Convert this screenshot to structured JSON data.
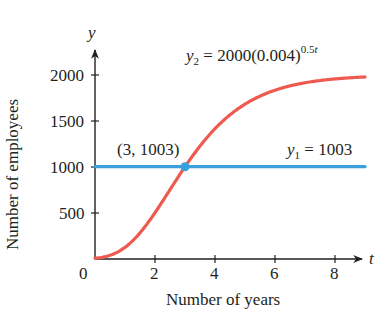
{
  "chart_data": {
    "type": "line",
    "title": "",
    "xlabel": "Number of years",
    "ylabel": "Number of employees",
    "x_axis_symbol": "t",
    "y_axis_symbol": "y",
    "xlim": [
      0,
      9
    ],
    "ylim": [
      0,
      2200
    ],
    "x_ticks": [
      2,
      4,
      6,
      8
    ],
    "x_tick_labels": [
      "2",
      "4",
      "6",
      "8"
    ],
    "origin_label": "0",
    "y_ticks": [
      500,
      1000,
      1500,
      2000
    ],
    "y_tick_labels": [
      "500",
      "1000",
      "1500",
      "2000"
    ],
    "grid": false,
    "series": [
      {
        "name": "y2",
        "label_var": "y",
        "label_sub": "2",
        "label_eq": "= 2000(0.004)",
        "label_exp": "0.5",
        "label_exp_var": "t",
        "formula": "y2 = 2000(0.004)^(0.5^t)",
        "color": "#ee5a50",
        "x": [
          0,
          0.5,
          1,
          1.5,
          2,
          2.5,
          3,
          3.5,
          4,
          4.5,
          5,
          5.5,
          6,
          6.5,
          7,
          7.5,
          8,
          8.5,
          9
        ],
        "values": [
          8,
          40,
          126,
          281,
          503,
          760,
          1003,
          1207,
          1410,
          1567,
          1689,
          1780,
          1843,
          1890,
          1922,
          1945,
          1961,
          1973,
          1981
        ]
      },
      {
        "name": "y1",
        "label_var": "y",
        "label_sub": "1",
        "label_eq": "= 1003",
        "formula": "y1 = 1003",
        "color": "#3aa0dc",
        "x": [
          0,
          9
        ],
        "values": [
          1003,
          1003
        ]
      }
    ],
    "annotations": [
      {
        "text": "(3, 1003)",
        "x": 3,
        "y": 1003,
        "marker_color": "#3aa0dc"
      }
    ]
  }
}
